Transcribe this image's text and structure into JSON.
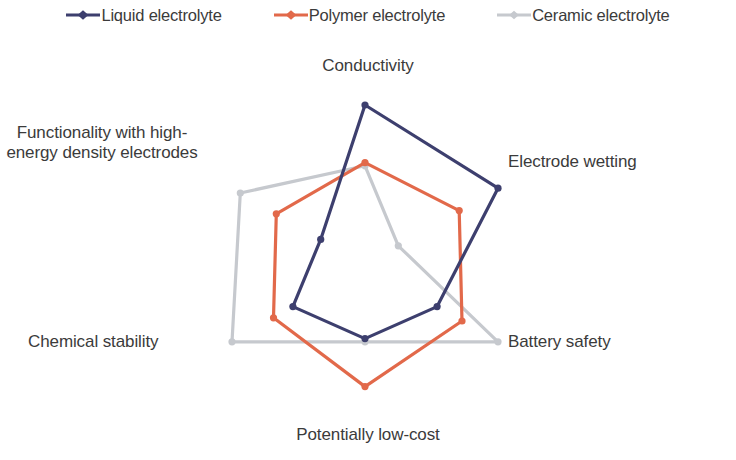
{
  "legend": {
    "position": "top",
    "items": [
      {
        "label": "Liquid electrolyte",
        "color": "#3d3f6e",
        "marker": "diamond-marker-icon"
      },
      {
        "label": "Polymer electrolyte",
        "color": "#e2694a",
        "marker": "diamond-marker-icon"
      },
      {
        "label": "Ceramic electrolyte",
        "color": "#c6c9ce",
        "marker": "diamond-marker-icon"
      }
    ]
  },
  "axis_labels": {
    "conductivity": "Conductivity",
    "electrode_wetting": "Electrode wetting",
    "battery_safety": "Battery safety",
    "potentially_low_cost": "Potentially low-cost",
    "chemical_stability": "Chemical stability",
    "functionality": "Functionality with high-energy density electrodes"
  },
  "chart_data": {
    "type": "radar",
    "title": "",
    "categories": [
      "Conductivity",
      "Electrode wetting",
      "Battery safety",
      "Potentially low-cost",
      "Chemical stability",
      "Functionality with high-energy density electrodes"
    ],
    "rlim": [
      0,
      5
    ],
    "grid": false,
    "legend_position": "top",
    "series": [
      {
        "name": "Liquid electrolyte",
        "color": "#3d3f6e",
        "values": [
          5.0,
          4.8,
          2.6,
          2.3,
          2.6,
          1.6
        ]
      },
      {
        "name": "Polymer electrolyte",
        "color": "#e2694a",
        "values": [
          3.2,
          3.4,
          3.5,
          3.8,
          3.3,
          3.2
        ]
      },
      {
        "name": "Ceramic electrolyte",
        "color": "#c6c9ce",
        "values": [
          3.1,
          1.2,
          4.8,
          2.4,
          4.8,
          4.5
        ]
      }
    ]
  }
}
